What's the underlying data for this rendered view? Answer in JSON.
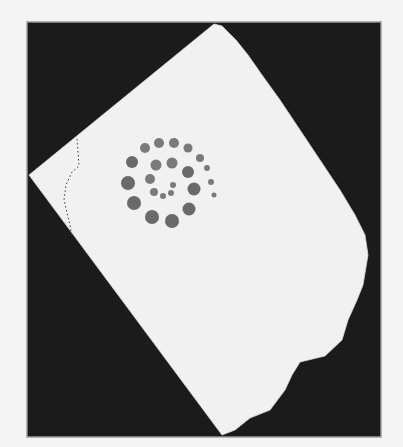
{
  "image": {
    "description": "Photograph of a torn sheet of white paper on a black background, with a spiral pattern of grey dots and a dotted curve near its left corner",
    "colors": {
      "page_bg": "#f4f4f4",
      "frame": "#1b1b1b",
      "frame_border": "#9a9a9a",
      "paper": "#f1f1f1",
      "dot": "#7a7a7a",
      "dot_dark": "#6a6a6a",
      "dotted_line": "#3a3a3a"
    },
    "frame": {
      "x": 27,
      "y": 22,
      "width": 354,
      "height": 415
    },
    "paper_outline": [
      [
        214,
        24
      ],
      [
        222,
        26
      ],
      [
        236,
        40
      ],
      [
        248,
        55
      ],
      [
        262,
        75
      ],
      [
        280,
        100
      ],
      [
        300,
        130
      ],
      [
        320,
        160
      ],
      [
        340,
        190
      ],
      [
        355,
        215
      ],
      [
        365,
        235
      ],
      [
        368,
        255
      ],
      [
        363,
        285
      ],
      [
        357,
        300
      ],
      [
        348,
        320
      ],
      [
        342,
        340
      ],
      [
        325,
        356
      ],
      [
        300,
        362
      ],
      [
        292,
        375
      ],
      [
        285,
        390
      ],
      [
        270,
        410
      ],
      [
        250,
        418
      ],
      [
        235,
        430
      ],
      [
        222,
        435
      ],
      [
        29,
        175
      ]
    ],
    "dots": [
      {
        "cx": 145,
        "cy": 148,
        "r": 5
      },
      {
        "cx": 159,
        "cy": 143,
        "r": 5
      },
      {
        "cx": 174,
        "cy": 143,
        "r": 5
      },
      {
        "cx": 188,
        "cy": 148,
        "r": 4.5
      },
      {
        "cx": 200,
        "cy": 158,
        "r": 4
      },
      {
        "cx": 207,
        "cy": 168,
        "r": 3
      },
      {
        "cx": 211,
        "cy": 182,
        "r": 3
      },
      {
        "cx": 214,
        "cy": 195,
        "r": 2.5
      },
      {
        "cx": 132,
        "cy": 162,
        "r": 6
      },
      {
        "cx": 156,
        "cy": 165,
        "r": 5.5
      },
      {
        "cx": 172,
        "cy": 163,
        "r": 5.5
      },
      {
        "cx": 188,
        "cy": 172,
        "r": 6
      },
      {
        "cx": 128,
        "cy": 183,
        "r": 7
      },
      {
        "cx": 150,
        "cy": 179,
        "r": 5
      },
      {
        "cx": 173,
        "cy": 185,
        "r": 3
      },
      {
        "cx": 154,
        "cy": 192,
        "r": 4
      },
      {
        "cx": 163,
        "cy": 196,
        "r": 3
      },
      {
        "cx": 171,
        "cy": 193,
        "r": 3
      },
      {
        "cx": 194,
        "cy": 189,
        "r": 6.5
      },
      {
        "cx": 134,
        "cy": 203,
        "r": 7
      },
      {
        "cx": 189,
        "cy": 209,
        "r": 6.5
      },
      {
        "cx": 152,
        "cy": 217,
        "r": 7
      },
      {
        "cx": 172,
        "cy": 221,
        "r": 7
      }
    ],
    "dotted_curve": [
      [
        77,
        139
      ],
      [
        78,
        152
      ],
      [
        79,
        166
      ],
      [
        72,
        172
      ],
      [
        66,
        185
      ],
      [
        64,
        200
      ],
      [
        67,
        213
      ],
      [
        70,
        225
      ],
      [
        72,
        237
      ]
    ]
  }
}
